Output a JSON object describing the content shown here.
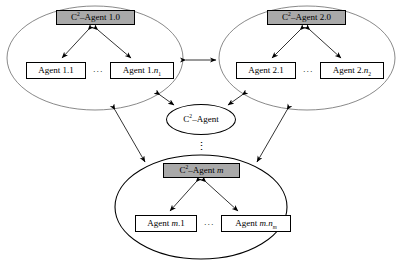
{
  "diagram": {
    "type": "node-link-diagram",
    "background": "#ffffff",
    "colors": {
      "commander_fill": "#a9a9a9",
      "agent_fill": "#ffffff",
      "hub_fill": "#ffffff",
      "stroke": "#000000"
    },
    "hub": {
      "label_prefix": "C",
      "label_exp": "2",
      "label_suffix": "–Agent"
    },
    "vertical_ellipsis": "⋮",
    "groups": [
      {
        "id": "group-1",
        "commander": {
          "prefix": "C",
          "exp": "2",
          "suffix": "–Agent 1.0"
        },
        "agents": [
          {
            "name_plain": "Agent 1.1",
            "base": "Agent 1.1",
            "var": "",
            "sub": ""
          },
          {
            "name_plain": "Agent 1.n1",
            "base": "Agent 1.",
            "var": "n",
            "sub": "1"
          }
        ],
        "ellipsis": "···"
      },
      {
        "id": "group-2",
        "commander": {
          "prefix": "C",
          "exp": "2",
          "suffix": "–Agent 2.0"
        },
        "agents": [
          {
            "name_plain": "Agent 2.1",
            "base": "Agent 2.1",
            "var": "",
            "sub": ""
          },
          {
            "name_plain": "Agent 2.n2",
            "base": "Agent 2.",
            "var": "n",
            "sub": "2"
          }
        ],
        "ellipsis": "···"
      },
      {
        "id": "group-m",
        "commander": {
          "prefix": "C",
          "exp": "2",
          "suffix": "–Agent ",
          "var": "m"
        },
        "agents": [
          {
            "name_plain": "Agent m.1",
            "base": "Agent ",
            "var": "m",
            "sub": "",
            "tail": ".1"
          },
          {
            "name_plain": "Agent m.nm",
            "base": "Agent ",
            "var": "m.n",
            "sub": "m",
            "tail": ""
          }
        ],
        "ellipsis": "···"
      }
    ],
    "edges": [
      {
        "from": "group-1-commander",
        "to": "group-1-agents",
        "style": "double-arrow"
      },
      {
        "from": "group-2-commander",
        "to": "group-2-agents",
        "style": "double-arrow"
      },
      {
        "from": "group-m-commander",
        "to": "group-m-agents",
        "style": "double-arrow"
      },
      {
        "from": "group-1",
        "to": "group-2",
        "style": "double-arrow"
      },
      {
        "from": "group-1",
        "to": "hub",
        "style": "double-arrow"
      },
      {
        "from": "group-2",
        "to": "hub",
        "style": "double-arrow"
      },
      {
        "from": "group-1",
        "to": "group-m",
        "style": "double-arrow"
      },
      {
        "from": "group-2",
        "to": "group-m",
        "style": "double-arrow"
      }
    ]
  }
}
